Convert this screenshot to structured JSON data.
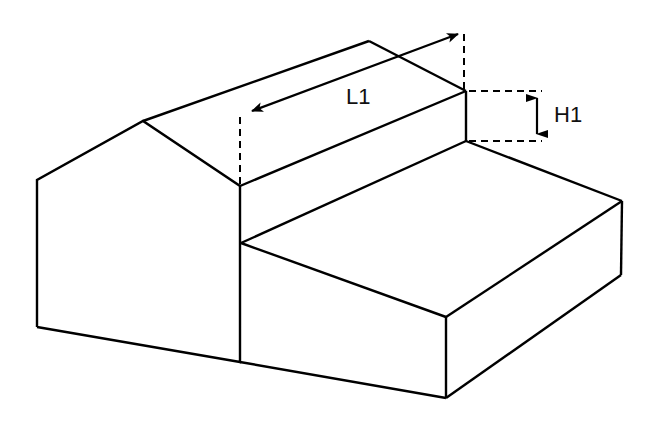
{
  "diagram": {
    "type": "isometric building drawing",
    "stroke_color": "#000000",
    "background": "#ffffff",
    "labels": {
      "length": "L1",
      "height": "H1"
    },
    "dimensions": [
      {
        "name": "L1",
        "meaning": "length of roof section along ridge direction",
        "style": "double-headed arrow with dashed extension lines"
      },
      {
        "name": "H1",
        "meaning": "height difference between main roof eave and annex roof",
        "style": "double-headed arrow with dashed extension lines"
      }
    ]
  }
}
